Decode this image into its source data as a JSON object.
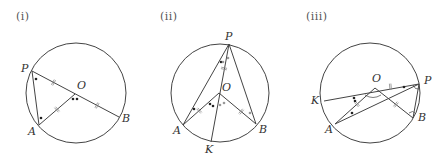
{
  "panels": [
    {
      "label": "(i)",
      "circle": {
        "cx": 76,
        "cy": 93,
        "r": 50
      },
      "points": {
        "P": {
          "x": 32,
          "y": 71,
          "lx": 21,
          "ly": 72
        },
        "A": {
          "x": 39,
          "y": 125,
          "lx": 28,
          "ly": 135
        },
        "O": {
          "x": 75,
          "y": 94,
          "lx": 77,
          "ly": 89
        },
        "B": {
          "x": 119,
          "y": 117,
          "lx": 122,
          "ly": 122
        }
      },
      "segments": [
        [
          "P",
          "B"
        ],
        [
          "P",
          "A"
        ],
        [
          "A",
          "O"
        ]
      ]
    },
    {
      "label": "(ii)",
      "circle": {
        "cx": 220,
        "cy": 93,
        "r": 49
      },
      "points": {
        "P": {
          "x": 229,
          "y": 44,
          "lx": 225,
          "ly": 40
        },
        "A": {
          "x": 183,
          "y": 125,
          "lx": 173,
          "ly": 134
        },
        "O": {
          "x": 219,
          "y": 93,
          "lx": 222,
          "ly": 91
        },
        "B": {
          "x": 256,
          "y": 124,
          "lx": 259,
          "ly": 133
        },
        "K": {
          "x": 211,
          "y": 142,
          "lx": 205,
          "ly": 153
        }
      },
      "segments": [
        [
          "P",
          "A"
        ],
        [
          "P",
          "B"
        ],
        [
          "P",
          "K"
        ],
        [
          "O",
          "A"
        ],
        [
          "O",
          "B"
        ]
      ]
    },
    {
      "label": "(iii)",
      "circle": {
        "cx": 370,
        "cy": 93,
        "r": 50
      },
      "points": {
        "P": {
          "x": 419,
          "y": 84,
          "lx": 424,
          "ly": 84
        },
        "A": {
          "x": 335,
          "y": 124,
          "lx": 325,
          "ly": 133
        },
        "O": {
          "x": 375,
          "y": 88,
          "lx": 372,
          "ly": 82
        },
        "B": {
          "x": 413,
          "y": 118,
          "lx": 418,
          "ly": 121
        },
        "K": {
          "x": 324,
          "y": 101,
          "lx": 311,
          "ly": 104
        }
      },
      "segments": [
        [
          "K",
          "P"
        ],
        [
          "A",
          "P"
        ],
        [
          "A",
          "O"
        ],
        [
          "O",
          "B"
        ],
        [
          "P",
          "B"
        ]
      ]
    }
  ],
  "colors": {
    "stroke": "#444444",
    "dot": "#222222",
    "tick": "#888888"
  }
}
